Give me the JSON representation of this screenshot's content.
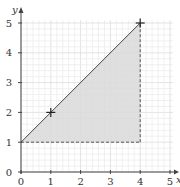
{
  "chart_data": {
    "type": "area",
    "title": "",
    "xlabel": "x",
    "ylabel": "y",
    "xlim": [
      0,
      5
    ],
    "ylim": [
      0,
      5
    ],
    "x_ticks": [
      "0",
      "1",
      "2",
      "3",
      "4",
      "5"
    ],
    "y_ticks": [
      "0",
      "1",
      "2",
      "3",
      "4",
      "5"
    ],
    "grid": true,
    "grid_minor_step": 0.2,
    "legend": null,
    "shaded_region": {
      "vertices": [
        [
          0,
          1
        ],
        [
          4,
          5
        ],
        [
          4,
          1
        ]
      ],
      "color": "#d9d9d9"
    },
    "series": [
      {
        "name": "line",
        "style": "solid",
        "points": [
          [
            0,
            1
          ],
          [
            4,
            5
          ]
        ]
      },
      {
        "name": "horizontal-dashed",
        "style": "dashed",
        "points": [
          [
            0,
            1
          ],
          [
            4,
            1
          ]
        ]
      },
      {
        "name": "vertical-dashed",
        "style": "dashed",
        "points": [
          [
            4,
            1
          ],
          [
            4,
            5
          ]
        ]
      }
    ],
    "markers": [
      {
        "x": 1,
        "y": 2,
        "shape": "cross"
      },
      {
        "x": 4,
        "y": 5,
        "shape": "cross"
      }
    ]
  },
  "colors": {
    "axis": "#444444",
    "grid_minor": "#ececec",
    "grid_major": "#dcdcdc",
    "shade": "#d9d9d9",
    "line": "#444444"
  }
}
